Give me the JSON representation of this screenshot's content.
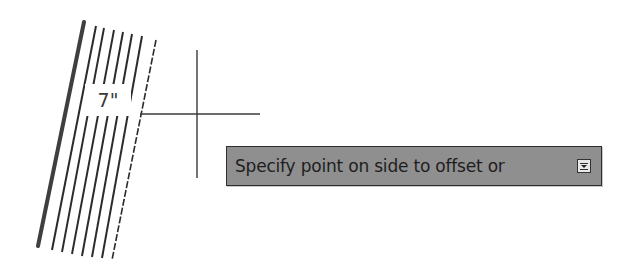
{
  "drawing": {
    "dimension_label": "7\"",
    "crosshair": {
      "x": 197,
      "y": 114
    },
    "colors": {
      "line": "#2b2b2b",
      "background": "#ffffff"
    }
  },
  "tooltip": {
    "prompt_text": "Specify point on side to offset or",
    "options_icon": "down-arrow-icon",
    "colors": {
      "background": "#8f8f8f",
      "border": "#2e2e2e",
      "text": "#1e1e1e"
    }
  }
}
